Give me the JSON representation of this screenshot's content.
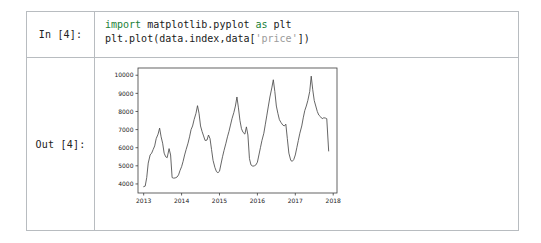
{
  "notebook": {
    "input_prompt": "In [4]:",
    "output_prompt": "Out [4]:",
    "code": {
      "line1_kw": "import",
      "line1_mod": " matplotlib.pyplot ",
      "line1_as": "as",
      "line1_alias": " plt",
      "line2_a": "plt.plot(data.index,data[",
      "line2_str": "'price'",
      "line2_b": "])"
    }
  },
  "chart_data": {
    "type": "line",
    "title": "",
    "xlabel": "",
    "ylabel": "",
    "xlim": [
      2012.85,
      2018.1
    ],
    "ylim": [
      3500,
      10400
    ],
    "grid": false,
    "legend": null,
    "line_color": "#4a4a4a",
    "xticks": [
      2013,
      2014,
      2015,
      2016,
      2017,
      2018
    ],
    "xtick_labels": [
      "2013",
      "2014",
      "2015",
      "2016",
      "2017",
      "2018"
    ],
    "yticks": [
      4000,
      5000,
      6000,
      7000,
      8000,
      9000,
      10000
    ],
    "ytick_labels": [
      "4000",
      "5000",
      "6000",
      "7000",
      "8000",
      "9000",
      "10000"
    ],
    "series": [
      {
        "name": "price",
        "x": [
          2013.0,
          2013.04,
          2013.08,
          2013.12,
          2013.17,
          2013.21,
          2013.25,
          2013.29,
          2013.33,
          2013.38,
          2013.42,
          2013.46,
          2013.5,
          2013.54,
          2013.58,
          2013.62,
          2013.67,
          2013.71,
          2013.75,
          2013.79,
          2013.83,
          2013.88,
          2013.92,
          2013.96,
          2014.0,
          2014.04,
          2014.08,
          2014.12,
          2014.17,
          2014.21,
          2014.25,
          2014.29,
          2014.33,
          2014.38,
          2014.42,
          2014.46,
          2014.5,
          2014.54,
          2014.58,
          2014.62,
          2014.67,
          2014.71,
          2014.75,
          2014.79,
          2014.83,
          2014.88,
          2014.92,
          2014.96,
          2015.0,
          2015.04,
          2015.08,
          2015.12,
          2015.17,
          2015.21,
          2015.25,
          2015.29,
          2015.33,
          2015.38,
          2015.42,
          2015.46,
          2015.5,
          2015.54,
          2015.58,
          2015.62,
          2015.67,
          2015.71,
          2015.75,
          2015.79,
          2015.83,
          2015.88,
          2015.92,
          2015.96,
          2016.0,
          2016.04,
          2016.08,
          2016.12,
          2016.17,
          2016.21,
          2016.25,
          2016.29,
          2016.33,
          2016.38,
          2016.42,
          2016.46,
          2016.5,
          2016.54,
          2016.58,
          2016.62,
          2016.67,
          2016.71,
          2016.75,
          2016.79,
          2016.83,
          2016.88,
          2016.92,
          2016.96,
          2017.0,
          2017.04,
          2017.08,
          2017.12,
          2017.17,
          2017.21,
          2017.25,
          2017.29,
          2017.33,
          2017.38,
          2017.42,
          2017.46,
          2017.5,
          2017.54,
          2017.58,
          2017.62,
          2017.67,
          2017.71,
          2017.75,
          2017.79,
          2017.83,
          2017.88
        ],
        "values": [
          3850,
          3880,
          4350,
          5150,
          5600,
          5700,
          5900,
          6100,
          6500,
          6750,
          7080,
          6600,
          6250,
          5700,
          5500,
          5450,
          5950,
          5600,
          4350,
          4320,
          4330,
          4380,
          4500,
          4750,
          4950,
          5250,
          5600,
          5900,
          6250,
          6600,
          7000,
          7200,
          7550,
          7900,
          8320,
          7900,
          7200,
          6900,
          6650,
          6400,
          6420,
          6700,
          6500,
          5900,
          5300,
          4900,
          4680,
          4620,
          4700,
          5100,
          5500,
          5850,
          6250,
          6600,
          6900,
          7250,
          7600,
          7950,
          8300,
          8800,
          8200,
          7500,
          7050,
          6850,
          6750,
          7150,
          6700,
          5400,
          5050,
          4980,
          5000,
          5050,
          5200,
          5600,
          6000,
          6400,
          6800,
          7300,
          7800,
          8300,
          8800,
          9300,
          9750,
          9100,
          8300,
          7900,
          7550,
          7400,
          7250,
          7200,
          7300,
          6500,
          5700,
          5300,
          5250,
          5350,
          5600,
          6000,
          6400,
          6800,
          7200,
          7650,
          8050,
          8300,
          8600,
          9100,
          9950,
          9200,
          8600,
          8300,
          8000,
          7800,
          7700,
          7600,
          7650,
          7640,
          7600,
          5820
        ]
      }
    ]
  }
}
